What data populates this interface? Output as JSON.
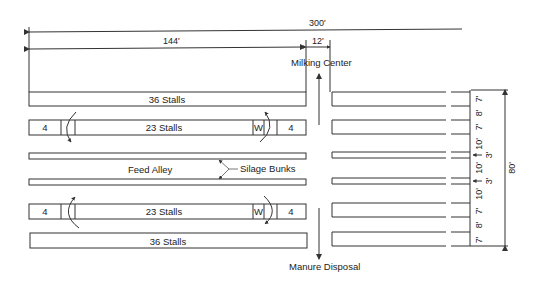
{
  "dimensions": {
    "overall_length": "300'",
    "barn_section_length": "144'",
    "milking_center_gap": "12'",
    "overall_width": "80'",
    "vertical_spacing": [
      "7'",
      "8'",
      "7'",
      "10'",
      "3'",
      "10'",
      "3'",
      "10'",
      "7'",
      "8'",
      "7'"
    ]
  },
  "labels": {
    "milking_center": "Milking Center",
    "manure_disposal": "Manure Disposal",
    "feed_alley": "Feed Alley",
    "silage_bunks": "Silage Bunks",
    "top_row": "36 Stalls",
    "upper_middle_row": "23 Stalls",
    "lower_middle_row": "23 Stalls",
    "bottom_row": "36 Stalls",
    "end_pen_count": "4",
    "waterer": "W"
  }
}
